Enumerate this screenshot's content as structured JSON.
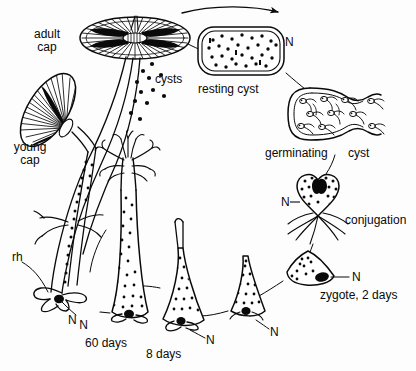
{
  "figure": {
    "background_color": "#fdfdfd",
    "ink_color": "#0a0a0a",
    "width": 416,
    "height": 371
  },
  "labels": {
    "adult_cap_line1": "adult",
    "adult_cap_line2": "cap",
    "young_cap_line1": "young",
    "young_cap_line2": "cap",
    "cysts": "cysts",
    "resting_cyst": "resting  cyst",
    "germinating": "germinating",
    "cyst": "cyst",
    "conjugation": "conjugation",
    "zygote": "zygote, 2 days",
    "days_60": "60  days",
    "days_8": "8 days",
    "rhizoid": "rh",
    "n_top": "N",
    "n_conjugation": "N",
    "n_zygote": "N",
    "n_rhizoid": "N",
    "n_60days": "N",
    "n_8days": "N",
    "n_juvenile": "N"
  },
  "stages": [
    {
      "name": "adult-cap",
      "label": "adult cap"
    },
    {
      "name": "cysts-release",
      "label": "cysts"
    },
    {
      "name": "resting-cyst",
      "label": "resting  cyst"
    },
    {
      "name": "germinating-cyst",
      "label": "germinating  cyst"
    },
    {
      "name": "conjugation",
      "label": "conjugation"
    },
    {
      "name": "zygote",
      "label": "zygote, 2 days"
    },
    {
      "name": "juvenile",
      "label": ""
    },
    {
      "name": "stage-8-days",
      "label": "8 days"
    },
    {
      "name": "stage-60-days",
      "label": "60  days"
    },
    {
      "name": "young-cap",
      "label": "young cap"
    }
  ]
}
